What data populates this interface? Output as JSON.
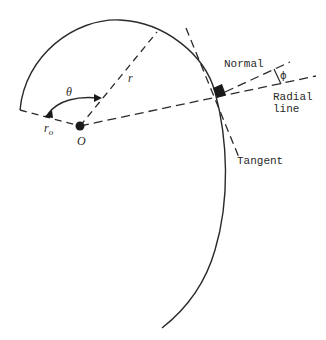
{
  "labels": {
    "theta": "θ",
    "r": "r",
    "r0_main": "r",
    "r0_sub": "o",
    "origin": "O",
    "normal": "Normal",
    "phi": "ϕ",
    "radial_line_1": "Radial",
    "radial_line_2": "line",
    "tangent": "Tangent"
  },
  "colors": {
    "ink": "#2a2a2a",
    "background": "#ffffff"
  }
}
